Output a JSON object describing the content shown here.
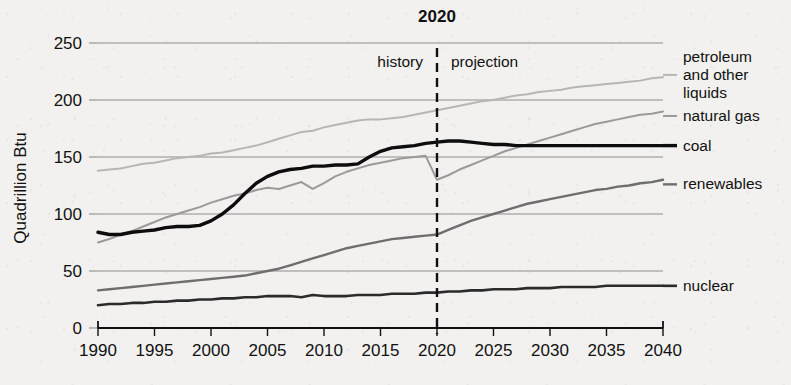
{
  "chart_data": {
    "type": "line",
    "title": "",
    "xlabel": "",
    "ylabel": "Quadrillion Btu",
    "xlim": [
      1990,
      2040
    ],
    "ylim": [
      0,
      250
    ],
    "ytick_step": 50,
    "xtick_step": 5,
    "grid": true,
    "legend_position": "right-inline",
    "xticks": [
      "1990",
      "1995",
      "2000",
      "2005",
      "2010",
      "2015",
      "2020",
      "2025",
      "2030",
      "2035",
      "2040"
    ],
    "yticks": [
      "0",
      "50",
      "100",
      "150",
      "200",
      "250"
    ],
    "annotations": {
      "divider_year": "2020",
      "divider_year_value": 2020,
      "history_label": "history",
      "projection_label": "projection"
    },
    "series": [
      {
        "name": "petroleum and other liquids",
        "label": "petroleum\nand other\nliquids",
        "color": "#b6b6b6",
        "width": 2.0,
        "label_y_value": 222,
        "x": [
          1990,
          1991,
          1992,
          1993,
          1994,
          1995,
          1996,
          1997,
          1998,
          1999,
          2000,
          2001,
          2002,
          2003,
          2004,
          2005,
          2006,
          2007,
          2008,
          2009,
          2010,
          2011,
          2012,
          2013,
          2014,
          2015,
          2016,
          2017,
          2018,
          2019,
          2020,
          2021,
          2022,
          2023,
          2024,
          2025,
          2026,
          2027,
          2028,
          2029,
          2030,
          2031,
          2032,
          2033,
          2034,
          2035,
          2036,
          2037,
          2038,
          2039,
          2040
        ],
        "y": [
          138,
          139,
          140,
          142,
          144,
          145,
          147,
          149,
          150,
          151,
          153,
          154,
          156,
          158,
          160,
          163,
          166,
          169,
          172,
          173,
          176,
          178,
          180,
          182,
          183,
          183,
          184,
          185,
          187,
          189,
          191,
          193,
          195,
          197,
          199,
          200,
          202,
          204,
          205,
          207,
          208,
          209,
          211,
          212,
          213,
          214,
          215,
          216,
          217,
          219,
          220
        ]
      },
      {
        "name": "natural gas",
        "label": "natural gas",
        "color": "#9a9a9a",
        "width": 2.0,
        "label_y_value": 186,
        "x": [
          1990,
          1991,
          1992,
          1993,
          1994,
          1995,
          1996,
          1997,
          1998,
          1999,
          2000,
          2001,
          2002,
          2003,
          2004,
          2005,
          2006,
          2007,
          2008,
          2009,
          2010,
          2011,
          2012,
          2013,
          2014,
          2015,
          2016,
          2017,
          2018,
          2019,
          2020,
          2021,
          2022,
          2023,
          2024,
          2025,
          2026,
          2027,
          2028,
          2029,
          2030,
          2031,
          2032,
          2033,
          2034,
          2035,
          2036,
          2037,
          2038,
          2039,
          2040
        ],
        "y": [
          75,
          78,
          82,
          85,
          89,
          93,
          97,
          100,
          103,
          106,
          110,
          113,
          116,
          118,
          121,
          123,
          122,
          125,
          128,
          122,
          127,
          133,
          137,
          140,
          143,
          145,
          147,
          149,
          150,
          151,
          130,
          134,
          139,
          143,
          147,
          151,
          155,
          158,
          161,
          164,
          167,
          170,
          173,
          176,
          179,
          181,
          183,
          185,
          187,
          188,
          190
        ]
      },
      {
        "name": "coal",
        "label": "coal",
        "color": "#0d0d0d",
        "width": 3.4,
        "label_y_value": 160,
        "x": [
          1990,
          1991,
          1992,
          1993,
          1994,
          1995,
          1996,
          1997,
          1998,
          1999,
          2000,
          2001,
          2002,
          2003,
          2004,
          2005,
          2006,
          2007,
          2008,
          2009,
          2010,
          2011,
          2012,
          2013,
          2014,
          2015,
          2016,
          2017,
          2018,
          2019,
          2020,
          2021,
          2022,
          2023,
          2024,
          2025,
          2026,
          2027,
          2028,
          2029,
          2030,
          2031,
          2032,
          2033,
          2034,
          2035,
          2036,
          2037,
          2038,
          2039,
          2040
        ],
        "y": [
          84,
          82,
          82,
          84,
          85,
          86,
          88,
          89,
          89,
          90,
          94,
          100,
          108,
          118,
          127,
          133,
          137,
          139,
          140,
          142,
          142,
          143,
          143,
          144,
          150,
          155,
          158,
          159,
          160,
          162,
          163,
          164,
          164,
          163,
          162,
          161,
          161,
          160,
          160,
          160,
          160,
          160,
          160,
          160,
          160,
          160,
          160,
          160,
          160,
          160,
          160
        ]
      },
      {
        "name": "renewables",
        "label": "renewables",
        "color": "#6e6e6e",
        "width": 2.4,
        "label_y_value": 126,
        "x": [
          1990,
          1991,
          1992,
          1993,
          1994,
          1995,
          1996,
          1997,
          1998,
          1999,
          2000,
          2001,
          2002,
          2003,
          2004,
          2005,
          2006,
          2007,
          2008,
          2009,
          2010,
          2011,
          2012,
          2013,
          2014,
          2015,
          2016,
          2017,
          2018,
          2019,
          2020,
          2021,
          2022,
          2023,
          2024,
          2025,
          2026,
          2027,
          2028,
          2029,
          2030,
          2031,
          2032,
          2033,
          2034,
          2035,
          2036,
          2037,
          2038,
          2039,
          2040
        ],
        "y": [
          33,
          34,
          35,
          36,
          37,
          38,
          39,
          40,
          41,
          42,
          43,
          44,
          45,
          46,
          48,
          50,
          52,
          55,
          58,
          61,
          64,
          67,
          70,
          72,
          74,
          76,
          78,
          79,
          80,
          81,
          82,
          86,
          90,
          94,
          97,
          100,
          103,
          106,
          109,
          111,
          113,
          115,
          117,
          119,
          121,
          122,
          124,
          125,
          127,
          128,
          130
        ]
      },
      {
        "name": "nuclear",
        "label": "nuclear",
        "color": "#2b2b2b",
        "width": 2.6,
        "label_y_value": 37,
        "x": [
          1990,
          1991,
          1992,
          1993,
          1994,
          1995,
          1996,
          1997,
          1998,
          1999,
          2000,
          2001,
          2002,
          2003,
          2004,
          2005,
          2006,
          2007,
          2008,
          2009,
          2010,
          2011,
          2012,
          2013,
          2014,
          2015,
          2016,
          2017,
          2018,
          2019,
          2020,
          2021,
          2022,
          2023,
          2024,
          2025,
          2026,
          2027,
          2028,
          2029,
          2030,
          2031,
          2032,
          2033,
          2034,
          2035,
          2036,
          2037,
          2038,
          2039,
          2040
        ],
        "y": [
          20,
          21,
          21,
          22,
          22,
          23,
          23,
          24,
          24,
          25,
          25,
          26,
          26,
          27,
          27,
          28,
          28,
          28,
          27,
          29,
          28,
          28,
          28,
          29,
          29,
          29,
          30,
          30,
          30,
          31,
          31,
          32,
          32,
          33,
          33,
          34,
          34,
          34,
          35,
          35,
          35,
          36,
          36,
          36,
          36,
          37,
          37,
          37,
          37,
          37,
          37
        ]
      }
    ]
  }
}
